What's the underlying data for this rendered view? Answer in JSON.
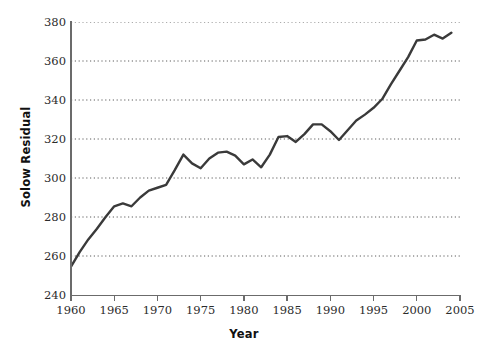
{
  "chart_data": {
    "type": "line",
    "title": "",
    "xlabel": "Year",
    "ylabel": "Solow Residual",
    "xlim": [
      1960,
      2005
    ],
    "ylim": [
      240,
      380
    ],
    "grid": "horizontal-dotted",
    "legend": "none",
    "line_color": "#3a3a3a",
    "x_ticks": [
      1960,
      1965,
      1970,
      1975,
      1980,
      1985,
      1990,
      1995,
      2000,
      2005
    ],
    "y_ticks": [
      240,
      260,
      280,
      300,
      320,
      340,
      360,
      380
    ],
    "x": [
      1960,
      1961,
      1962,
      1963,
      1964,
      1965,
      1966,
      1967,
      1968,
      1969,
      1970,
      1971,
      1972,
      1973,
      1974,
      1975,
      1976,
      1977,
      1978,
      1979,
      1980,
      1981,
      1982,
      1983,
      1984,
      1985,
      1986,
      1987,
      1988,
      1989,
      1990,
      1991,
      1992,
      1993,
      1994,
      1995,
      1996,
      1997,
      1998,
      1999,
      2000,
      2001,
      2002,
      2003,
      2004
    ],
    "values": [
      254.5,
      262.0,
      268.5,
      274.0,
      280.0,
      285.5,
      287.0,
      285.5,
      290.0,
      293.5,
      295.0,
      296.5,
      304.0,
      312.0,
      307.5,
      305.0,
      310.0,
      313.0,
      313.5,
      311.5,
      307.0,
      309.5,
      305.5,
      312.0,
      321.0,
      321.5,
      318.5,
      322.5,
      327.5,
      327.5,
      324.0,
      319.5,
      324.5,
      329.5,
      332.5,
      336.0,
      340.5,
      348.0,
      355.0,
      362.0,
      370.5,
      371.0,
      373.5,
      371.5,
      374.5
    ],
    "series": [
      {
        "name": "Solow Residual",
        "values": [
          254.5,
          262.0,
          268.5,
          274.0,
          280.0,
          285.5,
          287.0,
          285.5,
          290.0,
          293.5,
          295.0,
          296.5,
          304.0,
          312.0,
          307.5,
          305.0,
          310.0,
          313.0,
          313.5,
          311.5,
          307.0,
          309.5,
          305.5,
          312.0,
          321.0,
          321.5,
          318.5,
          322.5,
          327.5,
          327.5,
          324.0,
          319.5,
          324.5,
          329.5,
          332.5,
          336.0,
          340.5,
          348.0,
          355.0,
          362.0,
          370.5,
          371.0,
          373.5,
          371.5,
          374.5
        ]
      }
    ]
  },
  "axes": {
    "y_tick_labels": [
      "380",
      "360",
      "340",
      "320",
      "300",
      "280",
      "260",
      "240"
    ],
    "x_tick_labels": [
      "1960",
      "1965",
      "1970",
      "1975",
      "1980",
      "1985",
      "1990",
      "1995",
      "2000",
      "2005"
    ],
    "x_title": "Year",
    "y_title": "Solow Residual"
  }
}
